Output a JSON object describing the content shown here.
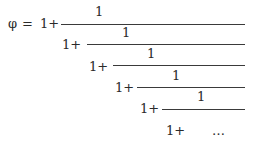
{
  "formula": {
    "lhs": "φ",
    "equals": "=",
    "terms": [
      {
        "whole": "1+",
        "numerator": "1"
      },
      {
        "whole": "1+",
        "numerator": "1"
      },
      {
        "whole": "1+",
        "numerator": "1"
      },
      {
        "whole": "1+",
        "numerator": "1"
      },
      {
        "whole": "1+",
        "numerator": "1"
      },
      {
        "whole": "1+",
        "numerator": "…"
      }
    ],
    "ellipsis": "…"
  }
}
